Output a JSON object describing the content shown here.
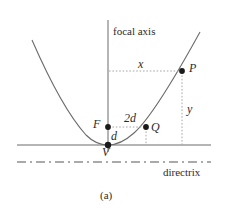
{
  "figure": {
    "caption": "(a)",
    "axis_label": "focal axis",
    "directrix_label": "directrix"
  },
  "points": [
    {
      "id": "P",
      "label": "P",
      "x": 182,
      "y": 71
    },
    {
      "id": "Q",
      "label": "Q",
      "x": 146,
      "y": 127
    },
    {
      "id": "F",
      "label": "F",
      "x": 108,
      "y": 127
    },
    {
      "id": "V",
      "label": "V",
      "x": 108,
      "y": 145
    }
  ],
  "measures": [
    {
      "id": "x",
      "label": "x"
    },
    {
      "id": "y",
      "label": "y"
    },
    {
      "id": "d",
      "label": "d"
    },
    {
      "id": "2d",
      "label": "2d"
    }
  ],
  "colors": {
    "curve": "#6b6b6b",
    "axis": "#6b6b6b",
    "guide": "#9a9a9a",
    "point": "#1a1a1a",
    "text": "#2b2b2b"
  }
}
